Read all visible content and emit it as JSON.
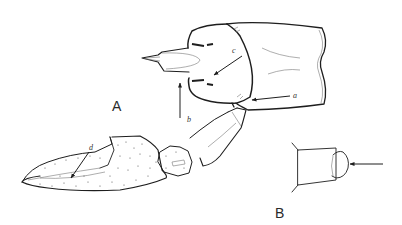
{
  "figure": {
    "panels": [
      {
        "id": "A",
        "label": "A",
        "description": "carapace and cheliped, lateral view"
      },
      {
        "id": "B",
        "label": "B",
        "description": "segment detail with arrow"
      }
    ],
    "annotations": [
      {
        "id": "a",
        "label": "a"
      },
      {
        "id": "b",
        "label": "b"
      },
      {
        "id": "c",
        "label": "c"
      },
      {
        "id": "d",
        "label": "d"
      }
    ],
    "colors": {
      "ink": "#1e1e1e",
      "background": "#ffffff"
    }
  }
}
